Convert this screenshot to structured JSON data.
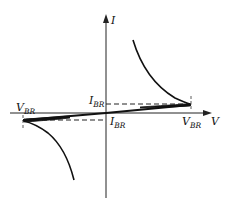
{
  "diagram": {
    "title": "",
    "type": "I-V characteristic",
    "axes": {
      "x_label": "V",
      "y_label": "I"
    },
    "annotations": {
      "v_br_left": {
        "main": "V",
        "sub": "BR"
      },
      "v_br_right": {
        "main": "V",
        "sub": "BR"
      },
      "i_br_upper": {
        "main": "I",
        "sub": "BR"
      },
      "i_br_lower": {
        "main": "I",
        "sub": "BR"
      }
    },
    "colors": {
      "stroke": "#111111",
      "background": "#ffffff"
    }
  }
}
